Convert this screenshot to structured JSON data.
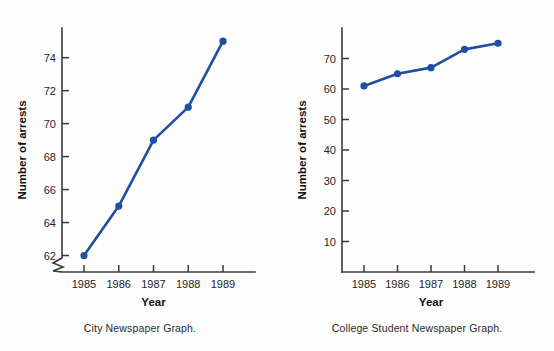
{
  "page": {
    "background_color": "#fdfdfd",
    "partial_top_text": ""
  },
  "colors": {
    "series": "#1f4fa0",
    "axis": "#3a3a3a",
    "text": "#262626"
  },
  "panels": [
    {
      "id": "city-newspaper",
      "caption": "City Newspaper Graph.",
      "xlabel": "Year",
      "ylabel": "Number of arrests",
      "has_axis_break": true,
      "ytick_labels": [
        "62",
        "64",
        "66",
        "68",
        "70",
        "72",
        "74"
      ],
      "xtick_labels": [
        "1985",
        "1986",
        "1987",
        "1988",
        "1989"
      ]
    },
    {
      "id": "college-student-newspaper",
      "caption": "College Student Newspaper Graph.",
      "xlabel": "Year",
      "ylabel": "Number of arrests",
      "has_axis_break": false,
      "ytick_labels": [
        "10",
        "20",
        "30",
        "40",
        "50",
        "60",
        "70"
      ],
      "xtick_labels": [
        "1985",
        "1986",
        "1987",
        "1988",
        "1989"
      ]
    }
  ],
  "chart_data": [
    {
      "type": "line",
      "title": "City Newspaper Graph.",
      "xlabel": "Year",
      "ylabel": "Number of arrests",
      "categories": [
        "1985",
        "1986",
        "1987",
        "1988",
        "1989"
      ],
      "x": [
        1985,
        1986,
        1987,
        1988,
        1989
      ],
      "values": [
        62,
        65,
        69,
        71,
        75
      ],
      "ylim": [
        61,
        75.8
      ],
      "yticks": [
        62,
        64,
        66,
        68,
        70,
        72,
        74
      ],
      "axis_break": true,
      "grid": false,
      "legend": "none",
      "series_color": "#1f4fa0",
      "marker": "circle"
    },
    {
      "type": "line",
      "title": "College Student Newspaper Graph.",
      "xlabel": "Year",
      "ylabel": "Number of arrests",
      "categories": [
        "1985",
        "1986",
        "1987",
        "1988",
        "1989"
      ],
      "x": [
        1985,
        1986,
        1987,
        1988,
        1989
      ],
      "values": [
        61,
        65,
        67,
        73,
        75
      ],
      "ylim": [
        0,
        80
      ],
      "yticks": [
        10,
        20,
        30,
        40,
        50,
        60,
        70
      ],
      "axis_break": false,
      "grid": false,
      "legend": "none",
      "series_color": "#1f4fa0",
      "marker": "circle"
    }
  ]
}
